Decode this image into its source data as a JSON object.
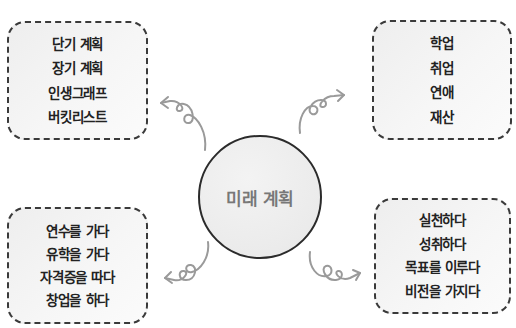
{
  "center": {
    "title": "미래 계획"
  },
  "boxes": [
    {
      "position": "top-left",
      "items": [
        "단기 계획",
        "장기 계획",
        "인생그래프",
        "버킷리스트"
      ]
    },
    {
      "position": "top-right",
      "items": [
        "학업",
        "취업",
        "연애",
        "재산"
      ]
    },
    {
      "position": "bottom-left",
      "items": [
        "연수를 가다",
        "유학을 가다",
        "자격증을 따다",
        "창업을 하다"
      ]
    },
    {
      "position": "bottom-right",
      "items": [
        "실천하다",
        "성취하다",
        "목표를 이루다",
        "비전을 가지다"
      ]
    }
  ],
  "arrows": [
    {
      "from": "center",
      "to": "top-left",
      "icon": "curly-arrow-icon"
    },
    {
      "from": "center",
      "to": "top-right",
      "icon": "curly-arrow-icon"
    },
    {
      "from": "center",
      "to": "bottom-left",
      "icon": "curly-arrow-icon"
    },
    {
      "from": "center",
      "to": "bottom-right",
      "icon": "curly-arrow-icon"
    }
  ],
  "colors": {
    "box_border": "#3a3a3a",
    "box_fill": "#f3f3f3",
    "item_text": "#222222",
    "circle_border": "#2b2b2b",
    "circle_fill": "#ebebeb",
    "center_text": "#787878",
    "arrow": "#9a9a9a"
  }
}
